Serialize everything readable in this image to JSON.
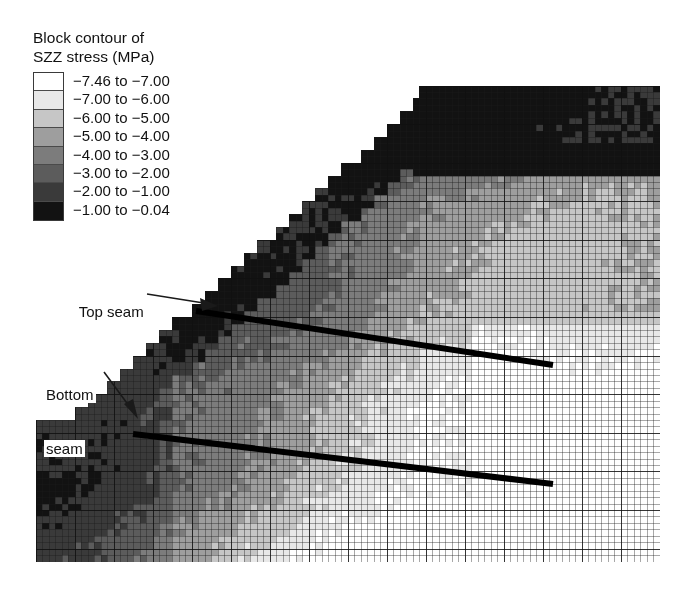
{
  "figure": {
    "title_line1": "Block contour of",
    "title_line2": "SZZ stress (MPa)",
    "background_color": "#ffffff"
  },
  "legend": {
    "title": "Block contour of SZZ stress (MPa)",
    "units": "MPa",
    "quantity": "SZZ stress",
    "entries": [
      {
        "label": "−7.46 to −7.00",
        "color": "#ffffff",
        "low": -7.46,
        "high": -7.0
      },
      {
        "label": "−7.00 to −6.00",
        "color": "#e8e8e8",
        "low": -7.0,
        "high": -6.0
      },
      {
        "label": "−6.00 to −5.00",
        "color": "#c6c6c6",
        "low": -6.0,
        "high": -5.0
      },
      {
        "label": "−5.00 to −4.00",
        "color": "#9e9e9e",
        "low": -5.0,
        "high": -4.0
      },
      {
        "label": "−4.00 to −3.00",
        "color": "#7c7c7c",
        "low": -4.0,
        "high": -3.0
      },
      {
        "label": "−3.00 to −2.00",
        "color": "#5c5c5c",
        "low": -3.0,
        "high": -2.0
      },
      {
        "label": "−2.00 to −1.00",
        "color": "#3a3a3a",
        "low": -2.0,
        "high": -1.0
      },
      {
        "label": "−1.00 to −0.04",
        "color": "#121212",
        "low": -1.0,
        "high": -0.04
      }
    ]
  },
  "annotations": [
    {
      "name": "top-seam",
      "text": "Top seam",
      "lines": [
        "Top seam"
      ]
    },
    {
      "name": "bottom-seam",
      "text": "Bottom seam",
      "lines": [
        "Bottom",
        "seam"
      ]
    }
  ],
  "chart_data": {
    "type": "heatmap",
    "title": "Block contour of SZZ stress (MPa)",
    "xlabel": "",
    "ylabel": "",
    "legend_position": "top-left",
    "grid": true,
    "colormap": "grayscale-8-band",
    "value_range": [
      -7.46,
      -0.04
    ],
    "mesh": {
      "cols": 96,
      "rows": 74,
      "line_color": "#2a2a2a"
    },
    "bands": [
      {
        "index": 0,
        "color": "#ffffff",
        "range": [
          -7.46,
          -7.0
        ]
      },
      {
        "index": 1,
        "color": "#e8e8e8",
        "range": [
          -7.0,
          -6.0
        ]
      },
      {
        "index": 2,
        "color": "#c6c6c6",
        "range": [
          -6.0,
          -5.0
        ]
      },
      {
        "index": 3,
        "color": "#9e9e9e",
        "range": [
          -5.0,
          -4.0
        ]
      },
      {
        "index": 4,
        "color": "#7c7c7c",
        "range": [
          -4.0,
          -3.0
        ]
      },
      {
        "index": 5,
        "color": "#5c5c5c",
        "range": [
          -3.0,
          -2.0
        ]
      },
      {
        "index": 6,
        "color": "#3a3a3a",
        "range": [
          -2.0,
          -1.0
        ]
      },
      {
        "index": 7,
        "color": "#121212",
        "range": [
          -1.0,
          -0.04
        ]
      }
    ],
    "features": {
      "excavation_boundary": "staircase rising left-to-right from lower-left to upper-right plateau",
      "top_seam_line": {
        "x1": 196,
        "y1": 311,
        "x2": 553,
        "y2": 365
      },
      "bottom_seam_line": {
        "x1": 133,
        "y1": 434,
        "x2": 553,
        "y2": 484
      },
      "high_stress_region": "dark band along upper excavation edge (-1.00 to -2.00 MPa)",
      "low_stress_region": "light band lower-right and below seams (-6.00 to -7.46 MPa)"
    }
  }
}
